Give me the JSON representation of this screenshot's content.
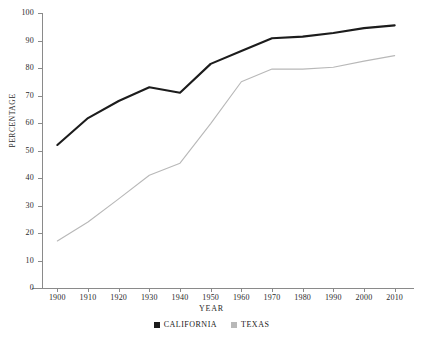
{
  "chart_data": {
    "type": "line",
    "title": "",
    "xlabel": "YEAR",
    "ylabel": "PERCENTAGE",
    "x": [
      1900,
      1910,
      1920,
      1930,
      1940,
      1950,
      1960,
      1970,
      1980,
      1990,
      2000,
      2010
    ],
    "categories": [
      "1900",
      "1910",
      "1920",
      "1930",
      "1940",
      "1950",
      "1960",
      "1970",
      "1980",
      "1990",
      "2000",
      "2010"
    ],
    "xlim": [
      1895,
      2015
    ],
    "ylim": [
      0,
      100
    ],
    "y_ticks": [
      0,
      10,
      20,
      30,
      40,
      50,
      60,
      70,
      80,
      90,
      100
    ],
    "y_tick_labels": [
      "0",
      "10",
      "20",
      "30",
      "40",
      "50",
      "60",
      "70",
      "80",
      "90",
      "100"
    ],
    "grid": false,
    "legend_position": "bottom-center",
    "series": [
      {
        "name": "CALIFORNIA",
        "color": "#1c1c1c",
        "line_width": 2.1,
        "values": [
          52.0,
          61.8,
          68.0,
          73.0,
          71.0,
          81.5,
          86.2,
          90.8,
          91.4,
          92.7,
          94.5,
          95.5
        ]
      },
      {
        "name": "TEXAS",
        "color": "#b8b8b8",
        "line_width": 1.1,
        "values": [
          17.1,
          24.0,
          32.4,
          41.0,
          45.4,
          59.8,
          75.0,
          79.6,
          79.6,
          80.3,
          82.5,
          84.5
        ]
      }
    ]
  },
  "legend": {
    "entries": [
      {
        "label": "CALIFORNIA",
        "color": "#1c1c1c"
      },
      {
        "label": "TEXAS",
        "color": "#b8b8b8"
      }
    ]
  }
}
